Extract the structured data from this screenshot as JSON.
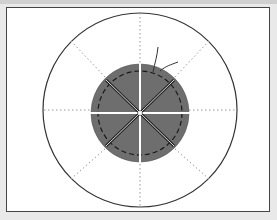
{
  "diagram": {
    "type": "schematic-cross-section",
    "colors": {
      "background": "#ffffff",
      "outline": "#333333",
      "disc_fill": "#6e6e6e",
      "gap": "#ffffff",
      "dotted_guides": "#999999",
      "dashed_circle": "#1a1a1a"
    },
    "outer_circle": {
      "cx": 140,
      "cy": 110,
      "r": 97
    },
    "inner_disc": {
      "cx": 140,
      "cy": 115,
      "r": 49,
      "sectors": 8
    },
    "dashed_circle": {
      "r": 42
    },
    "radial_guides": 8,
    "lead_wire": {
      "present": true,
      "position": "top-right"
    }
  }
}
